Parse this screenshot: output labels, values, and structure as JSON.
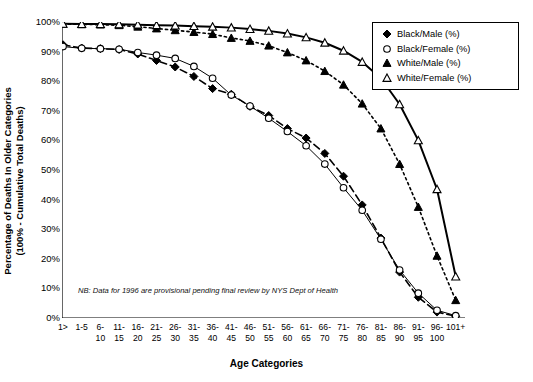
{
  "chart_data": {
    "type": "line",
    "title": "",
    "xlabel": "Age Categories",
    "ylabel": "Percentage of Deaths In Older Categories (100% - Cumulative Total Deaths)",
    "ylabel_line1": "Percentage of Deaths In Older Categories",
    "ylabel_line2": "(100% - Cumulative Total Deaths)",
    "ylim": [
      0,
      100
    ],
    "yticks": [
      "0%",
      "10%",
      "20%",
      "30%",
      "40%",
      "50%",
      "60%",
      "70%",
      "80%",
      "90%",
      "100%"
    ],
    "ytick_values": [
      0,
      10,
      20,
      30,
      40,
      50,
      60,
      70,
      80,
      90,
      100
    ],
    "grid": false,
    "legend_position": "top-right",
    "categories": [
      "1>",
      "1-5",
      "6-10",
      "11-15",
      "16-20",
      "21-25",
      "26-30",
      "31-35",
      "36-40",
      "41-45",
      "46-50",
      "51-55",
      "56-60",
      "61-65",
      "66-70",
      "71-75",
      "76-80",
      "81-85",
      "86-90",
      "91-95",
      "96-100",
      "101+"
    ],
    "categories_display": [
      {
        "top": "1>",
        "bottom": ""
      },
      {
        "top": "1-5",
        "bottom": ""
      },
      {
        "top": "6-",
        "bottom": "10"
      },
      {
        "top": "11-",
        "bottom": "15"
      },
      {
        "top": "16-",
        "bottom": "20"
      },
      {
        "top": "21-",
        "bottom": "25"
      },
      {
        "top": "26-",
        "bottom": "30"
      },
      {
        "top": "31-",
        "bottom": "35"
      },
      {
        "top": "36-",
        "bottom": "40"
      },
      {
        "top": "41-",
        "bottom": "45"
      },
      {
        "top": "46-",
        "bottom": "50"
      },
      {
        "top": "51-",
        "bottom": "55"
      },
      {
        "top": "56-",
        "bottom": "60"
      },
      {
        "top": "61-",
        "bottom": "65"
      },
      {
        "top": "66-",
        "bottom": "70"
      },
      {
        "top": "71-",
        "bottom": "75"
      },
      {
        "top": "76-",
        "bottom": "80"
      },
      {
        "top": "81-",
        "bottom": "85"
      },
      {
        "top": "86-",
        "bottom": "90"
      },
      {
        "top": "91-",
        "bottom": "95"
      },
      {
        "top": "96-",
        "bottom": "100"
      },
      {
        "top": "101+",
        "bottom": ""
      }
    ],
    "series": [
      {
        "name": "Black/Male (%)",
        "marker": "filled-diamond",
        "line": "dashed",
        "color": "#000000",
        "values": [
          92.3,
          91.2,
          91.0,
          90.7,
          89.2,
          87.0,
          84.8,
          81.6,
          77.5,
          75.6,
          71.5,
          68.4,
          64.0,
          60.8,
          55.6,
          47.9,
          38.2,
          27.0,
          15.5,
          7.0,
          2.0,
          0.6
        ]
      },
      {
        "name": "Black/Female (%)",
        "marker": "open-circle",
        "line": "solid-thin",
        "color": "#000000",
        "values": [
          91.7,
          91.1,
          91.0,
          90.8,
          89.7,
          88.8,
          87.7,
          85.0,
          81.0,
          75.3,
          71.6,
          67.5,
          63.0,
          58.2,
          52.0,
          44.0,
          36.4,
          26.6,
          16.2,
          8.4,
          2.6,
          0.8
        ]
      },
      {
        "name": "White/Male (%)",
        "marker": "filled-triangle",
        "line": "dotted",
        "color": "#000000",
        "values": [
          99.3,
          99.2,
          99.1,
          98.9,
          98.4,
          97.8,
          97.2,
          96.6,
          95.9,
          94.6,
          93.6,
          92.0,
          89.7,
          87.0,
          83.4,
          78.8,
          72.4,
          64.0,
          52.0,
          37.5,
          21.0,
          6.0
        ]
      },
      {
        "name": "White/Female (%)",
        "marker": "open-triangle",
        "line": "solid-thick",
        "color": "#000000",
        "values": [
          99.4,
          99.3,
          99.3,
          99.2,
          99.1,
          98.9,
          98.8,
          98.6,
          98.4,
          98.1,
          97.6,
          97.0,
          96.1,
          94.8,
          93.0,
          90.3,
          86.5,
          81.0,
          72.2,
          60.0,
          43.5,
          14.0
        ]
      }
    ],
    "note": "NB: Data for 1996 are provisional pending final review by NYS Dept of Health"
  },
  "legend": {
    "items": [
      {
        "label": "Black/Male (%)",
        "marker": "filled-diamond"
      },
      {
        "label": "Black/Female (%)",
        "marker": "open-circle"
      },
      {
        "label": "White/Male (%)",
        "marker": "filled-triangle"
      },
      {
        "label": "White/Female (%)",
        "marker": "open-triangle"
      }
    ]
  }
}
